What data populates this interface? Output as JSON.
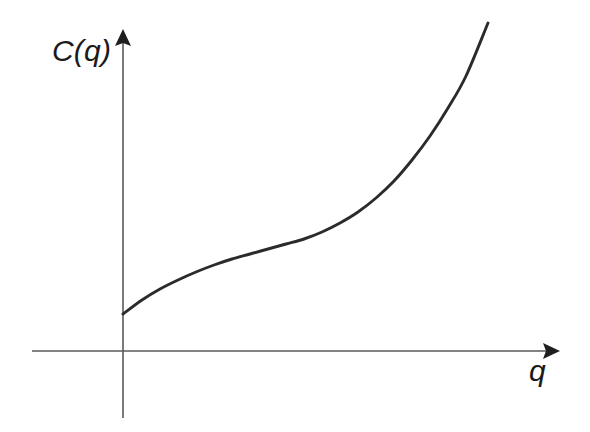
{
  "figure": {
    "background_color": "#ffffff",
    "width": 590,
    "height": 432,
    "axis_color": "#5a5a5a",
    "curve_color": "#2b2b2b",
    "arrow_color": "#1f1f1f"
  },
  "labels": {
    "y_axis": "C(q)",
    "x_axis": "q"
  },
  "icons": {
    "y_arrow": "arrow-up-icon",
    "x_arrow": "arrow-right-icon"
  },
  "chart_data": {
    "type": "line",
    "title": "",
    "subtitle": "",
    "xlabel": "q",
    "ylabel": "C(q)",
    "grid": false,
    "legend": null,
    "annotations": [],
    "axis_origin_px": [
      123,
      351
    ],
    "xlim": [
      0,
      1
    ],
    "ylim": [
      0,
      1
    ],
    "series": [
      {
        "name": "C(q)",
        "color": "#2b2b2b",
        "x": [
          0.0,
          0.05,
          0.1,
          0.15,
          0.2,
          0.25,
          0.3,
          0.35,
          0.4,
          0.45,
          0.5,
          0.55,
          0.6,
          0.65,
          0.7,
          0.75,
          0.8,
          0.85,
          0.9,
          0.95,
          1.0
        ],
        "y": [
          0.115,
          0.16,
          0.196,
          0.226,
          0.252,
          0.274,
          0.293,
          0.31,
          0.326,
          0.342,
          0.36,
          0.382,
          0.41,
          0.446,
          0.491,
          0.546,
          0.612,
          0.69,
          0.78,
          0.882,
          1.0
        ]
      }
    ],
    "points_px": [
      [
        123,
        314
      ],
      [
        142,
        300
      ],
      [
        160,
        289
      ],
      [
        178,
        280
      ],
      [
        196,
        272
      ],
      [
        214,
        265
      ],
      [
        232,
        259
      ],
      [
        250,
        254
      ],
      [
        268,
        249
      ],
      [
        286,
        244
      ],
      [
        304,
        239
      ],
      [
        322,
        232
      ],
      [
        340,
        223
      ],
      [
        358,
        212
      ],
      [
        376,
        198
      ],
      [
        394,
        181
      ],
      [
        412,
        160
      ],
      [
        430,
        136
      ],
      [
        448,
        108
      ],
      [
        466,
        76
      ],
      [
        488,
        23
      ]
    ],
    "curve_start_px": [
      123,
      314
    ],
    "curve_end_px": [
      488,
      23
    ],
    "inflection_px": [
      330,
      228
    ]
  }
}
